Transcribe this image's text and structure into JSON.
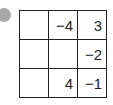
{
  "grid": {
    "rows": [
      [
        "",
        "−4",
        "3"
      ],
      [
        "",
        "",
        "−2"
      ],
      [
        "",
        "4",
        "−1"
      ]
    ]
  },
  "marker_color": "#a9a9a9"
}
